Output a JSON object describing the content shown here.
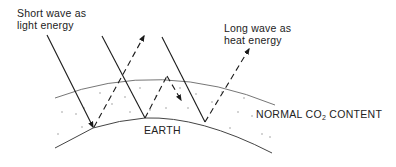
{
  "diagram": {
    "labels": {
      "short_wave_line1": "Short wave as",
      "short_wave_line2": "light energy",
      "long_wave_line1": "Long wave as",
      "long_wave_line2": "heat energy",
      "earth": "EARTH",
      "co2_prefix": "NORMAL CO",
      "co2_subscript": "2",
      "co2_suffix": " CONTENT"
    },
    "legend": {
      "solid_line": "incoming short wave radiation",
      "dashed_line": "outgoing long wave radiation"
    },
    "colors": {
      "line": "#1a1a1a",
      "curve": "#555555",
      "text": "#222222",
      "background": "#ffffff"
    }
  }
}
